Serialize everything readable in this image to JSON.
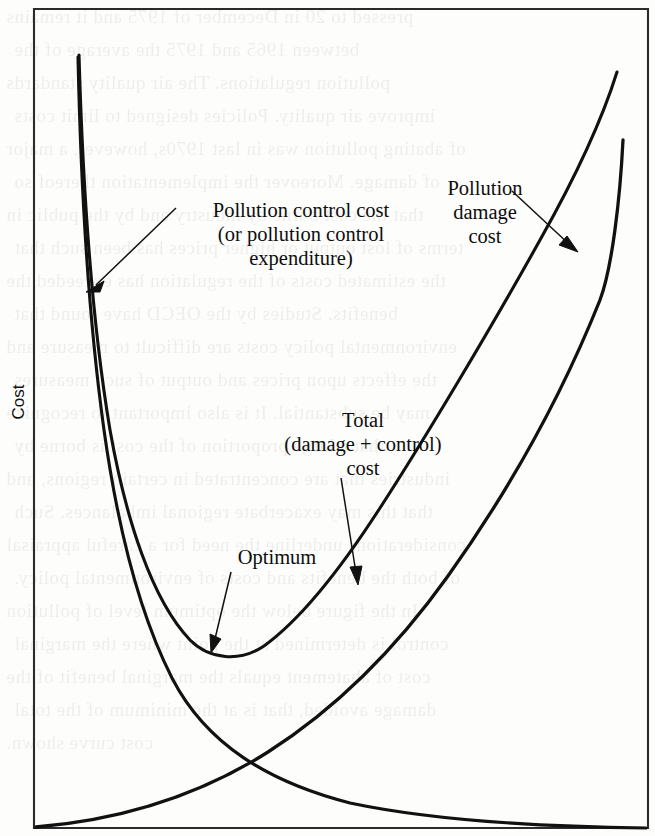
{
  "figure": {
    "axis": {
      "y_label": "Cost",
      "x_label": ""
    },
    "annotations": {
      "control_cost": "Pollution control cost\n(or pollution control\nexpenditure)",
      "control_cost_line1": "Pollution control cost",
      "control_cost_line2": "(or pollution control",
      "control_cost_line3": "expenditure)",
      "damage_cost_line1": "Pollution",
      "damage_cost_line2": "damage",
      "damage_cost_line3": "cost",
      "total_cost_line1": "Total",
      "total_cost_line2": "(damage + control)",
      "total_cost_line3": "cost",
      "optimum": "Optimum"
    },
    "colors": {
      "curve": "#111111",
      "frame": "#2a2a2a",
      "background": "#fdfdfc"
    }
  },
  "chart_data": {
    "type": "line",
    "title": "",
    "xlabel": "",
    "ylabel": "Cost",
    "xlim": [
      0,
      100
    ],
    "ylim": [
      0,
      100
    ],
    "grid": false,
    "legend": "none",
    "axis_ticks": {
      "x": [],
      "y": []
    },
    "series": [
      {
        "name": "Pollution control cost (or pollution control expenditure)",
        "description": "Monotonically decreasing convex curve: very high at low pollution (left), falling steeply then flattening toward zero at the right.",
        "x": [
          5,
          8,
          12,
          18,
          25,
          33,
          42,
          52,
          62,
          72,
          82,
          92,
          100
        ],
        "y": [
          94,
          78,
          60,
          43,
          32,
          24,
          18,
          13,
          9,
          6,
          4,
          2,
          1
        ]
      },
      {
        "name": "Pollution damage cost",
        "description": "Monotonically increasing convex curve rising from the origin at bottom-left to the top-right.",
        "x": [
          0,
          10,
          20,
          30,
          40,
          50,
          60,
          70,
          80,
          88,
          94,
          96
        ],
        "y": [
          0,
          3,
          7,
          13,
          21,
          31,
          43,
          56,
          70,
          80,
          88,
          92
        ]
      },
      {
        "name": "Total (damage + control) cost",
        "description": "U-shaped sum of the two curves; minimum marks the optimum level of pollution control.",
        "x": [
          5,
          10,
          15,
          20,
          25,
          31,
          36,
          42,
          50,
          58,
          66,
          74,
          82,
          90,
          96
        ],
        "y": [
          95,
          75,
          58,
          46,
          38,
          34,
          32,
          33,
          37,
          45,
          54,
          64,
          74,
          84,
          92
        ]
      }
    ],
    "annotations": [
      {
        "text": "Pollution control cost (or pollution control expenditure)",
        "points_to": "control-cost-curve",
        "target_xy": [
          9,
          66
        ]
      },
      {
        "text": "Pollution damage cost",
        "points_to": "damage-cost-curve",
        "target_xy": [
          85,
          74
        ]
      },
      {
        "text": "Total (damage + control) cost",
        "points_to": "total-cost-curve",
        "target_xy": [
          52,
          39
        ]
      },
      {
        "text": "Optimum",
        "points_to": "total-cost-curve-minimum",
        "target_xy": [
          36,
          32
        ]
      }
    ]
  },
  "ghost_text": {
    "lines": [
      "pressed to 20 in December of 1975 and it remains",
      "between 1965 and 1975 the average of the",
      "pollution regulations.   The   air   quality   standards",
      "improve air quality.  Policies designed to limit costs",
      "of abating pollution was in last 1970s, however, a major",
      "of damage. Moreover the implementation thereof so",
      "that the cost borne by industry and by the public in",
      "terms of lost output or higher prices has been such that",
      "the estimated costs of the regulation has exceeded the",
      "benefits.  Studies  by  the  OECD  have  found  that",
      "environmental policy costs are difficult to measure and",
      "the effects upon prices and output of such measures",
      "may be substantial. It is also important to recognize",
      "that  a  large  proportion  of  the  cost  is  borne  by",
      "industries that are concentrated in certain regions, and",
      "that this may exacerbate regional imbalances. Such",
      "considerations underline the need for a careful appraisal",
      "of both the benefits and costs of environmental policy.",
      "In  the  figure  below  the  optimum  level  of  pollution",
      "control is determined at the point where the marginal",
      "cost of abatement equals the marginal benefit of the",
      "damage avoided, that is at the minimum of the total",
      "cost curve shown."
    ]
  }
}
